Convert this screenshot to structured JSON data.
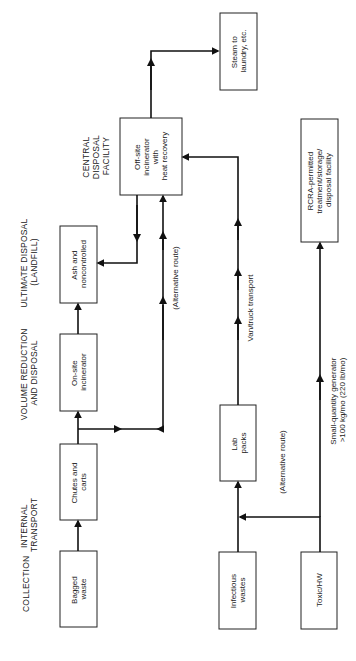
{
  "headers": {
    "collection": "COLLECTION",
    "internal_transport": [
      "INTERNAL",
      "TRANSPORT"
    ],
    "volume_reduction": [
      "VOLUME REDUCTION",
      "AND DISPOSAL"
    ],
    "ultimate_disposal": [
      "ULTIMATE DISPOSAL",
      "(LANDFILL)"
    ],
    "central_disposal": [
      "CENTRAL",
      "DISPOSAL",
      "FACILITY"
    ]
  },
  "boxes": {
    "bagged_waste": [
      "Bagged",
      "waste"
    ],
    "chutes_carts": [
      "Chutes and",
      "carts"
    ],
    "onsite_incinerator": [
      "On-site",
      "incinerator"
    ],
    "ash": [
      "Ash and",
      "noncontrolled"
    ],
    "offsite_incinerator": [
      "Off-site",
      "incinerator",
      "with",
      "heat recovery"
    ],
    "steam": [
      "Steam to",
      "laundry, etc."
    ],
    "infectious": [
      "Infectious",
      "wastes"
    ],
    "lab_packs": [
      "Lab",
      "packs"
    ],
    "toxic": [
      "Toxic/HW"
    ],
    "rcra": [
      "RCRA-permitted",
      "treatment/storage/",
      "disposal facility"
    ]
  },
  "labels": {
    "alt_route_upper": "(Alternative route)",
    "alt_route_lower": "(Alternative route)",
    "van_truck": "Van/truck transport",
    "small_qty": [
      "Small-quantity generator",
      ">100 kg/mo (220 lb/mo)"
    ]
  }
}
